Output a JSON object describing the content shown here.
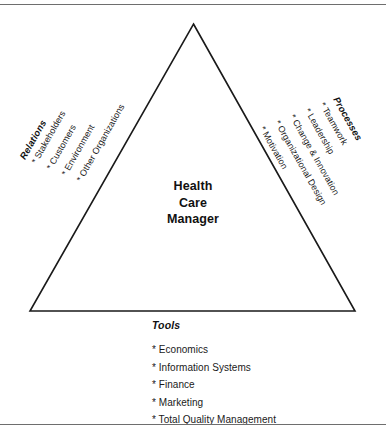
{
  "diagram": {
    "shape": "triangle",
    "line_color": "#1a1a1a",
    "background_color": "#ffffff",
    "rule_color": "#6e6e6e",
    "bullet_marker": "*",
    "center": {
      "lines": [
        "Health",
        "Care",
        "Manager"
      ]
    },
    "left": {
      "heading": "Relations",
      "items": [
        "* Stakeholders",
        "* Customers",
        "* Environment",
        "* Other Organizations"
      ]
    },
    "right": {
      "heading": "Processes",
      "items": [
        "* Teamwork",
        "* Leadership",
        "* Change & Innovation",
        "* Organizational Design",
        "* Motivation"
      ]
    },
    "bottom": {
      "heading": "Tools",
      "items": [
        "* Economics",
        "* Information Systems",
        "* Finance",
        "* Marketing",
        "* Total Quality Management"
      ]
    }
  }
}
